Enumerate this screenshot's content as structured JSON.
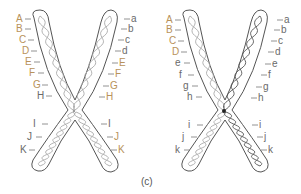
{
  "figure": {
    "caption": "(c)",
    "colors": {
      "outline": "#555555",
      "helix": "#a9a9a9",
      "helix_dark": "#222222",
      "label_tan": "#b8925a",
      "label_gray": "#6a6a6a"
    },
    "chromosomes": [
      {
        "name": "left-chromosome",
        "left_labels": [
          {
            "t": "A",
            "c": "tan",
            "x": 16,
            "y": 19
          },
          {
            "t": "B",
            "c": "tan",
            "x": 16,
            "y": 29
          },
          {
            "t": "C",
            "c": "tan",
            "x": 19,
            "y": 40
          },
          {
            "t": "D",
            "c": "tan",
            "x": 22,
            "y": 51
          },
          {
            "t": "E",
            "c": "tan",
            "x": 25,
            "y": 62
          },
          {
            "t": "F",
            "c": "tan",
            "x": 29,
            "y": 73
          },
          {
            "t": "G",
            "c": "tan",
            "x": 33,
            "y": 85
          },
          {
            "t": "H",
            "c": "gray",
            "x": 37,
            "y": 96
          },
          {
            "t": "I",
            "c": "gray",
            "x": 33,
            "y": 124
          },
          {
            "t": "J",
            "c": "gray",
            "x": 27,
            "y": 137
          },
          {
            "t": "K",
            "c": "gray",
            "x": 20,
            "y": 150
          }
        ],
        "right_labels": [
          {
            "t": "a",
            "c": "gray",
            "x": 131,
            "y": 19
          },
          {
            "t": "b",
            "c": "gray",
            "x": 128,
            "y": 29
          },
          {
            "t": "c",
            "c": "gray",
            "x": 125,
            "y": 40
          },
          {
            "t": "d",
            "c": "gray",
            "x": 122,
            "y": 51
          },
          {
            "t": "E",
            "c": "tan",
            "x": 119,
            "y": 63
          },
          {
            "t": "F",
            "c": "tan",
            "x": 115,
            "y": 74
          },
          {
            "t": "G",
            "c": "tan",
            "x": 110,
            "y": 86
          },
          {
            "t": "H",
            "c": "tan",
            "x": 106,
            "y": 97
          },
          {
            "t": "I",
            "c": "gray",
            "x": 108,
            "y": 124
          },
          {
            "t": "J",
            "c": "tan",
            "x": 114,
            "y": 137
          },
          {
            "t": "K",
            "c": "tan",
            "x": 118,
            "y": 150
          }
        ]
      },
      {
        "name": "right-chromosome",
        "left_labels": [
          {
            "t": "A",
            "c": "tan",
            "x": 166,
            "y": 20
          },
          {
            "t": "B",
            "c": "tan",
            "x": 166,
            "y": 30
          },
          {
            "t": "C",
            "c": "tan",
            "x": 169,
            "y": 41
          },
          {
            "t": "D",
            "c": "tan",
            "x": 172,
            "y": 52
          },
          {
            "t": "e",
            "c": "gray",
            "x": 175,
            "y": 63
          },
          {
            "t": "f",
            "c": "gray",
            "x": 179,
            "y": 75
          },
          {
            "t": "g",
            "c": "gray",
            "x": 183,
            "y": 86
          },
          {
            "t": "h",
            "c": "gray",
            "x": 187,
            "y": 97
          },
          {
            "t": "i",
            "c": "gray",
            "x": 188,
            "y": 125
          },
          {
            "t": "j",
            "c": "gray",
            "x": 182,
            "y": 137
          },
          {
            "t": "k",
            "c": "gray",
            "x": 175,
            "y": 150
          }
        ],
        "right_labels": [
          {
            "t": "a",
            "c": "gray",
            "x": 284,
            "y": 20
          },
          {
            "t": "b",
            "c": "gray",
            "x": 281,
            "y": 30
          },
          {
            "t": "c",
            "c": "gray",
            "x": 278,
            "y": 41
          },
          {
            "t": "d",
            "c": "gray",
            "x": 275,
            "y": 52
          },
          {
            "t": "e",
            "c": "gray",
            "x": 272,
            "y": 64
          },
          {
            "t": "f",
            "c": "gray",
            "x": 268,
            "y": 75
          },
          {
            "t": "g",
            "c": "gray",
            "x": 263,
            "y": 87
          },
          {
            "t": "h",
            "c": "gray",
            "x": 258,
            "y": 98
          },
          {
            "t": "i",
            "c": "gray",
            "x": 259,
            "y": 125
          },
          {
            "t": "j",
            "c": "gray",
            "x": 264,
            "y": 137
          },
          {
            "t": "k",
            "c": "gray",
            "x": 268,
            "y": 150
          }
        ]
      }
    ]
  }
}
